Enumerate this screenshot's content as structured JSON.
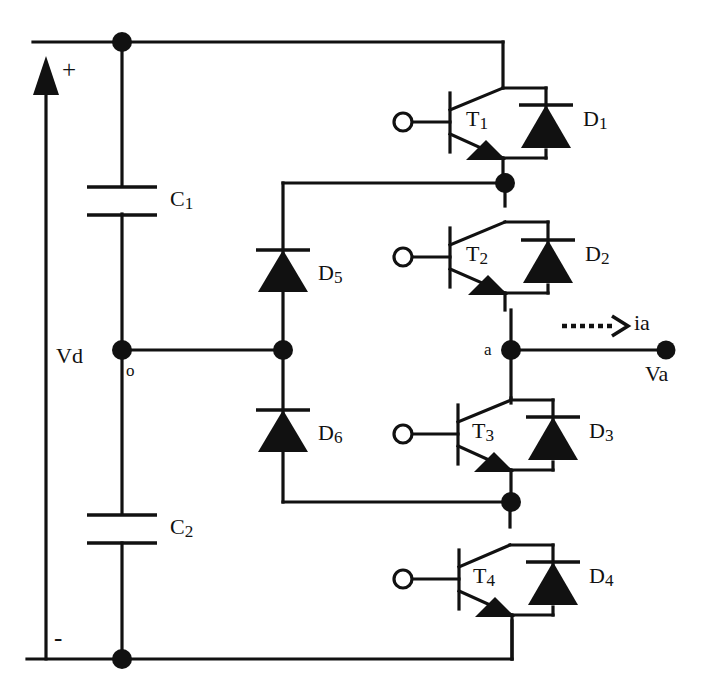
{
  "diagram": {
    "type": "circuit-schematic",
    "line_color": "#111111",
    "background": "#ffffff"
  },
  "labels": {
    "plus": "+",
    "minus": "-",
    "vd": "Vd",
    "node_o": "o",
    "node_a": "a",
    "va": "Va",
    "ia": "ia",
    "c1": "C1",
    "c2": "C2",
    "t1": "T1",
    "t2": "T2",
    "t3": "T3",
    "t4": "T4",
    "d1": "D1",
    "d2": "D2",
    "d3": "D3",
    "d4": "D4",
    "d5": "D5",
    "d6": "D6"
  },
  "components": {
    "capacitors": [
      {
        "name": "C1",
        "label": "C1"
      },
      {
        "name": "C2",
        "label": "C2"
      }
    ],
    "transistors": [
      {
        "name": "T1",
        "label": "T1",
        "gate_terminal": true
      },
      {
        "name": "T2",
        "label": "T2",
        "gate_terminal": true
      },
      {
        "name": "T3",
        "label": "T3",
        "gate_terminal": true
      },
      {
        "name": "T4",
        "label": "T4",
        "gate_terminal": true
      }
    ],
    "antiparallel_diodes": [
      {
        "name": "D1",
        "label": "D1"
      },
      {
        "name": "D2",
        "label": "D2"
      },
      {
        "name": "D3",
        "label": "D3"
      },
      {
        "name": "D4",
        "label": "D4"
      }
    ],
    "clamping_diodes": [
      {
        "name": "D5",
        "label": "D5"
      },
      {
        "name": "D6",
        "label": "D6"
      }
    ],
    "nodes": [
      {
        "name": "o",
        "label": "o",
        "kind": "neutral-point"
      },
      {
        "name": "a",
        "label": "a",
        "kind": "output-phase"
      }
    ],
    "terminals": [
      {
        "name": "Va",
        "label": "Va",
        "kind": "output"
      }
    ],
    "sources": [
      {
        "name": "Vd",
        "label": "Vd",
        "polarity_top": "+",
        "polarity_bottom": "-"
      }
    ],
    "currents": [
      {
        "name": "ia",
        "label": "ia",
        "style": "dotted-arrow",
        "direction": "right"
      }
    ]
  }
}
